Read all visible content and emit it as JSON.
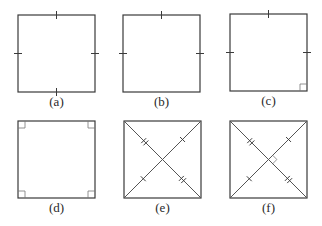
{
  "figure": {
    "colors": {
      "line": "#3a3a3a",
      "background": "#ffffff"
    },
    "panels": [
      {
        "id": "a",
        "label": "(a)",
        "x": 18,
        "y": 15,
        "size": 77,
        "side_ticks": [
          "top",
          "right",
          "bottom",
          "left"
        ],
        "right_angles": [],
        "diagonals": false
      },
      {
        "id": "b",
        "label": "(b)",
        "x": 123,
        "y": 15,
        "size": 77,
        "side_ticks": [
          "top",
          "right",
          "left"
        ],
        "right_angles": [],
        "diagonals": false
      },
      {
        "id": "c",
        "label": "(c)",
        "x": 230,
        "y": 14,
        "size": 77,
        "side_ticks": [
          "top",
          "right",
          "left"
        ],
        "right_angles": [
          "bottom-right"
        ],
        "diagonals": false
      },
      {
        "id": "d",
        "label": "(d)",
        "x": 18,
        "y": 121,
        "size": 77,
        "side_ticks": [],
        "right_angles": [
          "top-left",
          "top-right",
          "bottom-left",
          "bottom-right"
        ],
        "diagonals": false
      },
      {
        "id": "e",
        "label": "(e)",
        "x": 124,
        "y": 121,
        "size": 77,
        "side_ticks": [],
        "right_angles": [],
        "diagonals": true,
        "diagonal_ticks": true,
        "center_right_angle": false
      },
      {
        "id": "f",
        "label": "(f)",
        "x": 230,
        "y": 121,
        "size": 77,
        "side_ticks": [],
        "right_angles": [],
        "diagonals": true,
        "diagonal_ticks": true,
        "center_right_angle": true
      }
    ]
  }
}
